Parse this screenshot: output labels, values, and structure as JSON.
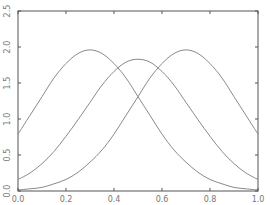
{
  "chart_data": {
    "type": "line",
    "title": "",
    "xlabel": "",
    "ylabel": "",
    "xlim": [
      0.0,
      1.0
    ],
    "ylim": [
      0.0,
      2.5
    ],
    "grid": false,
    "legend": null,
    "x_ticks": [
      "0.0",
      "0.2",
      "0.4",
      "0.6",
      "0.8",
      "1.0"
    ],
    "y_ticks": [
      "0.0",
      "0.5",
      "1.0",
      "1.5",
      "2.0",
      "2.5"
    ],
    "x": [
      0.0,
      0.05,
      0.1,
      0.15,
      0.2,
      0.25,
      0.3,
      0.35,
      0.4,
      0.45,
      0.5,
      0.55,
      0.6,
      0.65,
      0.7,
      0.75,
      0.8,
      0.85,
      0.9,
      0.95,
      1.0
    ],
    "series": [
      {
        "name": "curve-peak-0.3",
        "values": [
          0.79,
          1.05,
          1.31,
          1.57,
          1.77,
          1.91,
          1.96,
          1.91,
          1.77,
          1.57,
          1.31,
          1.05,
          0.79,
          0.57,
          0.4,
          0.26,
          0.16,
          0.1,
          0.05,
          0.03,
          0.015
        ]
      },
      {
        "name": "curve-peak-0.5",
        "values": [
          0.16,
          0.25,
          0.38,
          0.55,
          0.76,
          0.99,
          1.23,
          1.47,
          1.66,
          1.79,
          1.83,
          1.79,
          1.66,
          1.47,
          1.23,
          0.99,
          0.76,
          0.55,
          0.38,
          0.25,
          0.16
        ]
      },
      {
        "name": "curve-peak-0.7",
        "values": [
          0.015,
          0.03,
          0.05,
          0.1,
          0.16,
          0.26,
          0.4,
          0.57,
          0.79,
          1.05,
          1.31,
          1.57,
          1.77,
          1.91,
          1.96,
          1.91,
          1.77,
          1.57,
          1.31,
          1.05,
          0.79
        ]
      }
    ],
    "line_color": "#8a8a8a",
    "frame_color": "#555555"
  }
}
